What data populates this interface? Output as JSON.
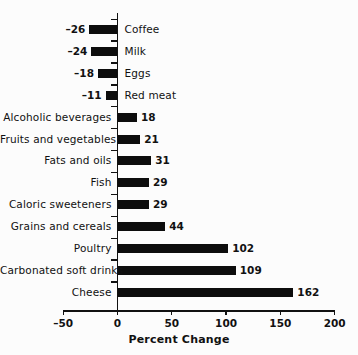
{
  "chart_data": {
    "type": "bar",
    "orientation": "horizontal",
    "title": "",
    "xlabel": "Percent Change",
    "ylabel": "",
    "xlim": [
      -50,
      200
    ],
    "xticks": [
      -50,
      0,
      50,
      100,
      150,
      200
    ],
    "xtick_labels": [
      "–50",
      "0",
      "50",
      "100",
      "150",
      "200"
    ],
    "grid": false,
    "legend": null,
    "bar_color": "#0d0d0d",
    "categories": [
      "Coffee",
      "Milk",
      "Eggs",
      "Red meat",
      "Alcoholic beverages",
      "Fruits and vegetables",
      "Fats and oils",
      "Fish",
      "Caloric sweeteners",
      "Grains and cereals",
      "Poultry",
      "Carbonated soft drinks",
      "Cheese"
    ],
    "values": [
      -26,
      -24,
      -18,
      -11,
      18,
      21,
      31,
      29,
      29,
      44,
      102,
      109,
      162
    ],
    "value_labels": [
      "–26",
      "–24",
      "–18",
      "–11",
      "18",
      "21",
      "31",
      "29",
      "29",
      "44",
      "102",
      "109",
      "162"
    ]
  },
  "axis": {
    "x_title": "Percent Change"
  }
}
